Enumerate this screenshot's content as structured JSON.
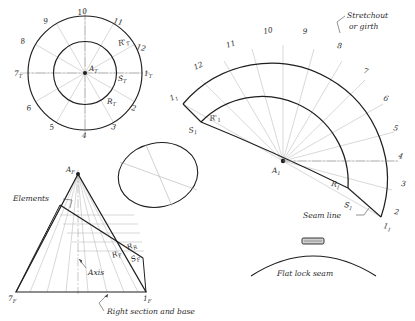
{
  "drawing": {
    "title": "Development of an oblique cone - stretchout layout",
    "ink_color": "#1f1f1f",
    "construction_color": "#9a9a9a",
    "background": "#ffffff"
  },
  "plan_view": {
    "name": "top-view-circles",
    "center_label": "A",
    "center_sub": "T",
    "radius_labels": [
      {
        "text": "R'",
        "sub": "T"
      },
      {
        "text": "S",
        "sub": "T"
      },
      {
        "text": "R",
        "sub": "T"
      }
    ],
    "division_labels": [
      {
        "n": "1",
        "sub": "T"
      },
      {
        "n": "2",
        "sub": ""
      },
      {
        "n": "3",
        "sub": ""
      },
      {
        "n": "4",
        "sub": ""
      },
      {
        "n": "5",
        "sub": ""
      },
      {
        "n": "6",
        "sub": ""
      },
      {
        "n": "7",
        "sub": "T"
      },
      {
        "n": "8",
        "sub": ""
      },
      {
        "n": "9",
        "sub": ""
      },
      {
        "n": "10",
        "sub": ""
      },
      {
        "n": "11",
        "sub": ""
      },
      {
        "n": "12",
        "sub": ""
      }
    ]
  },
  "elevation_view": {
    "name": "front-elevation-cone",
    "apex_label": "A",
    "apex_sub": "F",
    "base_left_label": "7",
    "base_left_sub": "F",
    "base_right_label": "1",
    "base_right_sub": "F",
    "inner_labels": [
      {
        "text": "R",
        "sub": "F"
      },
      {
        "text": "R",
        "sub": "R"
      },
      {
        "text": "S",
        "sub": "F"
      }
    ],
    "annotations": [
      {
        "text": "Elements"
      },
      {
        "text": "Axis"
      },
      {
        "text": "Right section and base"
      }
    ]
  },
  "right_section": {
    "name": "right-section-ellipse",
    "caption": ""
  },
  "stretchout": {
    "name": "stretchout-fan",
    "center_label": "A",
    "center_sub": "1",
    "title": "Stretchout",
    "title2": "or girth",
    "seam_label": "Seam line",
    "inner_labels": [
      {
        "text": "R'",
        "sub": "1"
      },
      {
        "text": "R",
        "sub": "1"
      },
      {
        "text": "S",
        "sub": "1"
      },
      {
        "text": "S",
        "sub": "1"
      }
    ],
    "division_labels": [
      {
        "n": "1",
        "sub": "1"
      },
      {
        "n": "2",
        "sub": ""
      },
      {
        "n": "3",
        "sub": ""
      },
      {
        "n": "4",
        "sub": ""
      },
      {
        "n": "5",
        "sub": ""
      },
      {
        "n": "6",
        "sub": ""
      },
      {
        "n": "7",
        "sub": ""
      },
      {
        "n": "8",
        "sub": ""
      },
      {
        "n": "9",
        "sub": ""
      },
      {
        "n": "10",
        "sub": ""
      },
      {
        "n": "11",
        "sub": ""
      },
      {
        "n": "12",
        "sub": ""
      },
      {
        "n": "1",
        "sub": "1"
      }
    ]
  },
  "seam_detail": {
    "name": "flat-lock-seam",
    "caption": "Flat lock seam"
  }
}
